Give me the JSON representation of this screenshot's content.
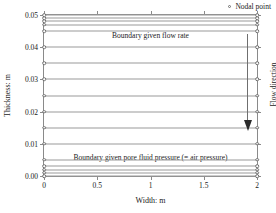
{
  "chart_data": {
    "type": "line",
    "title": "",
    "xlabel": "Width: m",
    "ylabel": "Thickness: m",
    "xlim": [
      0,
      2
    ],
    "ylim": [
      0,
      0.05
    ],
    "xticks": [
      "0",
      "0.5",
      "1",
      "1.5",
      "2"
    ],
    "xtick_values": [
      0,
      0.5,
      1,
      1.5,
      2
    ],
    "yticks": [
      "0.00",
      "0.01",
      "0.02",
      "0.03",
      "0.04",
      "0.05"
    ],
    "ytick_values": [
      0,
      0.01,
      0.02,
      0.03,
      0.04,
      0.05
    ],
    "grid": false,
    "legend_position": "top-right",
    "series": [
      {
        "name": "Nodal point",
        "marker": "open-circle",
        "x": [
          0,
          2
        ],
        "rows_y": [
          0.0,
          0.001,
          0.002,
          0.003,
          0.005,
          0.01,
          0.015,
          0.02,
          0.025,
          0.03,
          0.035,
          0.04,
          0.045,
          0.047,
          0.048,
          0.049,
          0.05
        ]
      }
    ],
    "annotations": [
      {
        "name": "top-boundary-note",
        "text": "Boundary given flow rate",
        "position": "top-center"
      },
      {
        "name": "bottom-boundary-note",
        "text": "Boundary given pore fluid pressure (= air pressure)",
        "position": "bottom-center"
      },
      {
        "name": "flow-direction-note",
        "text": "Flow direction",
        "position": "right-outside",
        "arrow": "down"
      }
    ]
  },
  "legend": {
    "entries": [
      {
        "label": "Nodal point",
        "marker": "open-circle"
      }
    ]
  },
  "colors": {
    "frame": "#8a8a8a",
    "mesh_line": "#9a9a9a",
    "node_stroke": "#6f6f6f",
    "arrow": "#2b2b2b",
    "text": "#1a1a1a",
    "background": "#ffffff"
  }
}
